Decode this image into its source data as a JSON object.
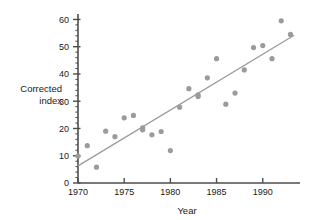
{
  "chart_data": {
    "type": "scatter",
    "title": "",
    "xlabel": "Year",
    "ylabel": "Corrected index",
    "ylabel_lines": [
      "Corrected",
      "index"
    ],
    "xlim": [
      1970,
      1993.6
    ],
    "ylim": [
      0,
      62
    ],
    "grid": false,
    "legend": false,
    "x_major_ticks": [
      1970,
      1975,
      1980,
      1985,
      1990
    ],
    "x_tick_labels": [
      "1970",
      "1975",
      "1980",
      "1985",
      "1990"
    ],
    "y_major_ticks": [
      0,
      10,
      20,
      30,
      40,
      50,
      60
    ],
    "y_tick_labels": [
      "0",
      "10",
      "20",
      "30",
      "40",
      "50",
      "60"
    ],
    "y_minor_step": 2,
    "marker_color": "#9b9b9b",
    "line_color": "#9b9b9b",
    "axis_color": "#4d4d4d",
    "x": [
      1970,
      1971,
      1972,
      1973,
      1974,
      1975,
      1976,
      1977,
      1977,
      1978,
      1979,
      1980,
      1981,
      1982,
      1983,
      1983,
      1984,
      1985,
      1986,
      1987,
      1988,
      1989,
      1990,
      1991,
      1992,
      1993
    ],
    "y": [
      9.9,
      13.7,
      5.8,
      19.0,
      17.0,
      23.9,
      24.8,
      20.2,
      19.5,
      17.7,
      18.9,
      11.9,
      27.8,
      34.6,
      32.3,
      31.7,
      38.6,
      45.6,
      28.9,
      33.0,
      41.5,
      49.7,
      50.4,
      45.6,
      59.5,
      54.5
    ],
    "trendline": {
      "x": [
        1970,
        1993.4
      ],
      "y": [
        6.3,
        54.2
      ]
    }
  }
}
